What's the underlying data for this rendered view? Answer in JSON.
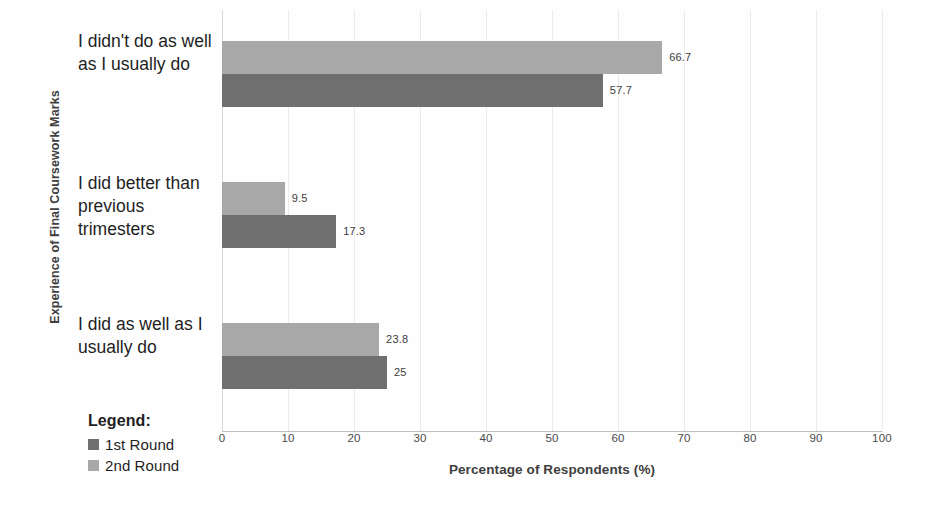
{
  "chart_data": {
    "type": "bar",
    "orientation": "horizontal",
    "title": "",
    "xlabel": "Percentage of Respondents (%)",
    "ylabel": "Experience of Final Coursework Marks",
    "xlim": [
      0,
      100
    ],
    "xticks": [
      "0",
      "10",
      "20",
      "30",
      "40",
      "50",
      "60",
      "70",
      "80",
      "90",
      "100"
    ],
    "grid": true,
    "legend_position": "bottom-left",
    "legend_title": "Legend:",
    "categories": [
      "I didn't do as well as I usually do",
      "I did better than previous trimesters",
      "I did as well as I usually do"
    ],
    "series": [
      {
        "name": "1st Round",
        "color": "#6f6f6f",
        "values": [
          57.7,
          17.3,
          25
        ],
        "labels": [
          "57.7",
          "17.3",
          "25"
        ]
      },
      {
        "name": "2nd Round",
        "color": "#a8a8a8",
        "values": [
          66.7,
          9.5,
          23.8
        ],
        "labels": [
          "66.7",
          "9.5",
          "23.8"
        ]
      }
    ]
  }
}
